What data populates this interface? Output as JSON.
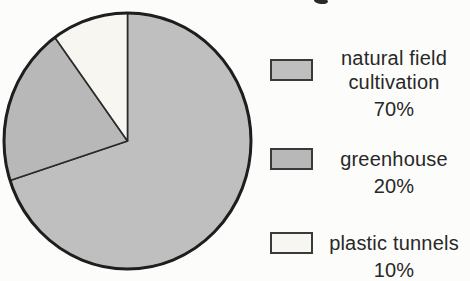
{
  "page": {
    "background_color": "#fcfcfb",
    "note_top_edge": "tiny remnant of a cropped-off chart title"
  },
  "chart_data": {
    "type": "pie",
    "title": "",
    "direction": "clockwise",
    "start_angle_deg": 0,
    "legend_position": "right",
    "outline_color": "#1e1e1e",
    "divider_color": "#2a2a2a",
    "geometry": {
      "cx": 127.5,
      "cy": 141,
      "rx": 123.5,
      "ry": 128
    },
    "categories": [
      "natural field cultivation",
      "greenhouse",
      "plastic tunnels"
    ],
    "values": [
      70,
      20,
      10
    ],
    "slices": [
      {
        "label": "natural field cultivation",
        "legend_name": "natural field\ncultivation",
        "percent_label": "70%",
        "value": 70,
        "color": "#bfbfbf"
      },
      {
        "label": "greenhouse",
        "legend_name": "greenhouse",
        "percent_label": "20%",
        "value": 20,
        "color": "#b8b8b8"
      },
      {
        "label": "plastic tunnels",
        "legend_name": "plastic tunnels",
        "percent_label": "10%",
        "value": 10,
        "color": "#f7f6f0"
      }
    ]
  }
}
